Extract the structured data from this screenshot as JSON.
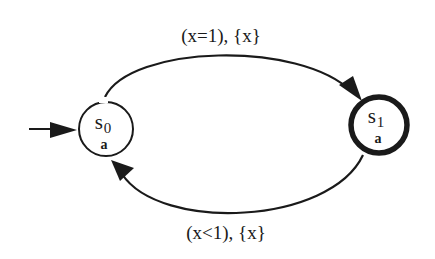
{
  "diagram": {
    "type": "timed-automaton",
    "colors": {
      "ink": "#1a1a1a",
      "background": "#ffffff"
    },
    "states": [
      {
        "id": "s0",
        "name": "s",
        "subscript": "0",
        "proposition": "a",
        "initial": true,
        "accepting": false
      },
      {
        "id": "s1",
        "name": "s",
        "subscript": "1",
        "proposition": "a",
        "initial": false,
        "accepting": true
      }
    ],
    "edges": [
      {
        "from": "s0",
        "to": "s1",
        "label": "(x=1), {x}",
        "guard": "x=1",
        "reset": "{x}"
      },
      {
        "from": "s1",
        "to": "s0",
        "label": "(x<1), {x}",
        "guard": "x<1",
        "reset": "{x}"
      }
    ]
  }
}
